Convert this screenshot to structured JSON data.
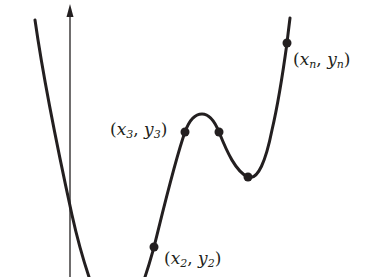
{
  "diagram": {
    "type": "function-graph-with-data-points",
    "colors": {
      "curve": "#231f20",
      "axis": "#231f20",
      "background": "#ffffff"
    },
    "axis": {
      "name": "y-axis",
      "has_arrow": true
    },
    "points": [
      {
        "id": "p2",
        "var_x": "x",
        "sub_x": "2",
        "var_y": "y",
        "sub_y": "2",
        "label": "(x2, y2)"
      },
      {
        "id": "p3",
        "var_x": "x",
        "sub_x": "3",
        "var_y": "y",
        "sub_y": "3",
        "label": "(x3, y3)"
      },
      {
        "id": "pn",
        "var_x": "x",
        "sub_x": "n",
        "var_y": "y",
        "sub_y": "n",
        "label": "(xn, yn)"
      }
    ],
    "unlabeled_points": 2,
    "punct": {
      "open": "(",
      "comma": ", ",
      "close": ")"
    }
  }
}
